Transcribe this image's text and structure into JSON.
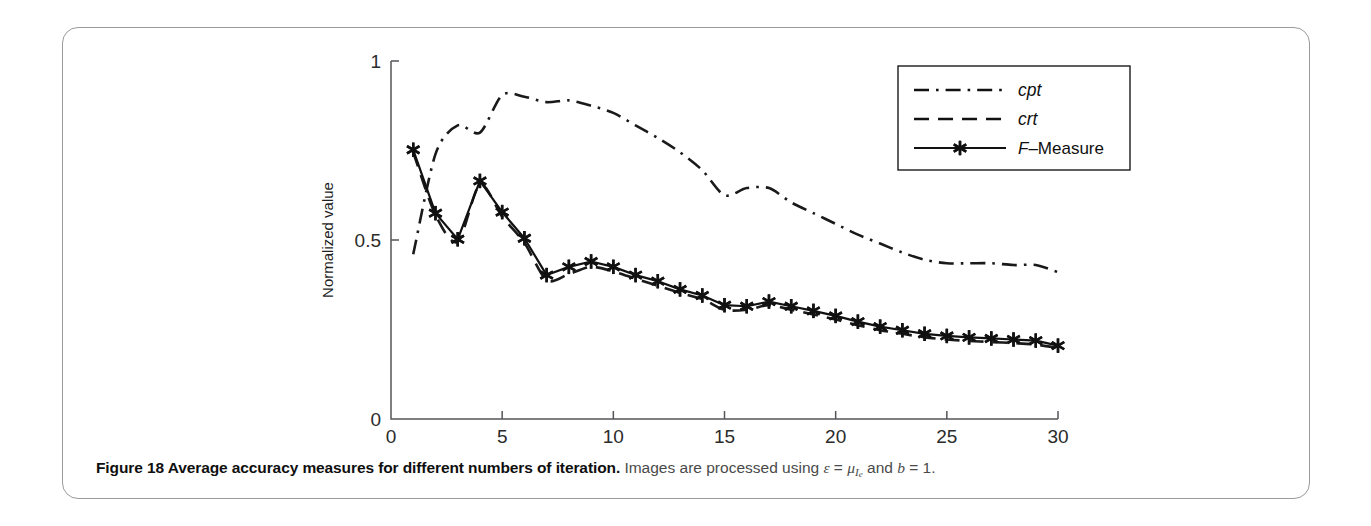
{
  "figure": {
    "caption_title": "Figure 18 Average accuracy measures for different numbers of iteration.",
    "caption_rest_pre": "Images are processed using ",
    "caption_eps": "ε",
    "caption_eq1": " = ",
    "caption_mu": "μ",
    "caption_mu_sub": "I",
    "caption_mu_subsub": "e",
    "caption_and": " and ",
    "caption_b": "b",
    "caption_eq2": " = 1."
  },
  "chart_data": {
    "type": "line",
    "title": "",
    "xlabel_main": "Iteration,",
    "xlabel_italic": "t",
    "ylabel": "Normalized value",
    "xlim": [
      0,
      30
    ],
    "ylim": [
      0,
      1
    ],
    "xticks": [
      0,
      5,
      10,
      15,
      20,
      25,
      30
    ],
    "xtick_labels": [
      "0",
      "5",
      "10",
      "15",
      "20",
      "25",
      "30"
    ],
    "yticks": [
      0,
      0.5,
      1
    ],
    "ytick_labels": [
      "0",
      "0.5",
      "1"
    ],
    "grid": false,
    "legend_position": "top-right",
    "x": [
      1,
      2,
      3,
      4,
      5,
      6,
      7,
      8,
      9,
      10,
      11,
      12,
      13,
      14,
      15,
      16,
      17,
      18,
      19,
      20,
      21,
      22,
      23,
      24,
      25,
      26,
      27,
      28,
      29,
      30
    ],
    "series": [
      {
        "name": "cpt",
        "label": "cpt",
        "style": "dashdot",
        "marker": "none",
        "color": "#1a1a1a",
        "italic_label": true,
        "values": [
          0.46,
          0.74,
          0.82,
          0.8,
          0.905,
          0.9,
          0.885,
          0.89,
          0.875,
          0.855,
          0.82,
          0.785,
          0.745,
          0.695,
          0.625,
          0.645,
          0.645,
          0.605,
          0.575,
          0.545,
          0.515,
          0.49,
          0.465,
          0.445,
          0.435,
          0.435,
          0.435,
          0.43,
          0.43,
          0.41
        ]
      },
      {
        "name": "crt",
        "label": "crt",
        "style": "dashed",
        "marker": "none",
        "color": "#1a1a1a",
        "italic_label": true,
        "values": [
          0.745,
          0.57,
          0.495,
          0.655,
          0.565,
          0.492,
          0.388,
          0.405,
          0.425,
          0.412,
          0.392,
          0.372,
          0.352,
          0.335,
          0.305,
          0.305,
          0.318,
          0.305,
          0.292,
          0.278,
          0.262,
          0.248,
          0.238,
          0.228,
          0.222,
          0.218,
          0.215,
          0.212,
          0.208,
          0.198
        ]
      },
      {
        "name": "F-Measure",
        "label": "F–Measure",
        "style": "solid",
        "marker": "asterisk",
        "color": "#111111",
        "italic_label": false,
        "values": [
          0.752,
          0.575,
          0.502,
          0.665,
          0.578,
          0.505,
          0.402,
          0.425,
          0.44,
          0.425,
          0.402,
          0.385,
          0.362,
          0.345,
          0.318,
          0.315,
          0.328,
          0.315,
          0.302,
          0.288,
          0.272,
          0.258,
          0.248,
          0.238,
          0.232,
          0.228,
          0.225,
          0.222,
          0.219,
          0.205
        ]
      }
    ],
    "legend_items": [
      {
        "label": "cpt",
        "style": "dashdot",
        "marker": "none",
        "italic": true
      },
      {
        "label": "crt",
        "style": "dashed",
        "marker": "none",
        "italic": true
      },
      {
        "label": "F–Measure",
        "style": "solid",
        "marker": "asterisk",
        "italic": false,
        "leading_italic": "F",
        "rest": "–Measure"
      }
    ]
  }
}
